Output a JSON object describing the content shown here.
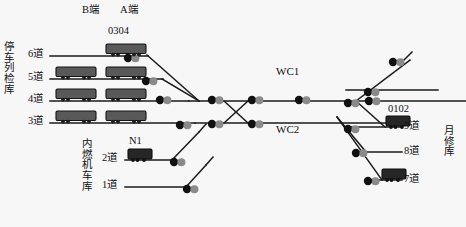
{
  "diagram": {
    "kind": "railway-depot-track-layout",
    "background_color": "#f7f7f7",
    "line_color": "#1a1a1a",
    "car_fill": "#595959",
    "loco_fill": "#262626",
    "switch_black": "#111111",
    "switch_gray": "#8a8a8a"
  },
  "ends": {
    "b_end": "B端",
    "a_end": "A端"
  },
  "buildings": {
    "left": {
      "name": "停车列检库",
      "chars": [
        "停",
        "车",
        "列",
        "检",
        "库"
      ]
    },
    "lower_left": {
      "name": "内燃机车库",
      "chars": [
        "内",
        "燃",
        "机",
        "车",
        "库"
      ]
    },
    "right": {
      "name": "月修库",
      "chars": [
        "月",
        "修",
        "库"
      ]
    }
  },
  "main_lines": [
    {
      "id": "wc1",
      "label": "WC1"
    },
    {
      "id": "wc2",
      "label": "WC2"
    }
  ],
  "tracks": [
    {
      "id": "t6",
      "label": "6道",
      "building": "停车列检库"
    },
    {
      "id": "t5",
      "label": "5道",
      "building": "停车列检库"
    },
    {
      "id": "t4",
      "label": "4道",
      "building": "停车列检库"
    },
    {
      "id": "t3",
      "label": "3道",
      "building": "停车列检库"
    },
    {
      "id": "t2",
      "label": "2道",
      "building": "内燃机车库"
    },
    {
      "id": "t1",
      "label": "1道",
      "building": "内燃机车库"
    },
    {
      "id": "t9",
      "label": "9道",
      "building": "月修库"
    },
    {
      "id": "t8",
      "label": "8道",
      "building": "月修库"
    },
    {
      "id": "t7",
      "label": "7道",
      "building": "月修库"
    }
  ],
  "rolling_stock_labels": [
    {
      "id": "unit-0304",
      "label": "0304",
      "on_track": "6道"
    },
    {
      "id": "unit-n1",
      "label": "N1",
      "on_track": "2道"
    },
    {
      "id": "unit-0102",
      "label": "0102",
      "on_track": "9道"
    }
  ],
  "label_positions": {
    "b_end": {
      "x": 82,
      "y": 5
    },
    "a_end": {
      "x": 120,
      "y": 5
    },
    "u0304": {
      "x": 108,
      "y": 26
    },
    "n1": {
      "x": 128,
      "y": 148
    },
    "u0102": {
      "x": 392,
      "y": 117
    },
    "wc1": {
      "x": 276,
      "y": 66
    },
    "wc2": {
      "x": 276,
      "y": 124
    },
    "t6": {
      "x": 29,
      "y": 46
    },
    "t5": {
      "x": 29,
      "y": 70
    },
    "t4": {
      "x": 29,
      "y": 92
    },
    "t3": {
      "x": 29,
      "y": 114
    },
    "t2": {
      "x": 103,
      "y": 161
    },
    "t1": {
      "x": 103,
      "y": 188
    },
    "t9": {
      "x": 405,
      "y": 131
    },
    "t8": {
      "x": 405,
      "y": 157
    },
    "t7": {
      "x": 405,
      "y": 182
    },
    "left_building": {
      "x": 6,
      "y": 42
    },
    "lower_building": {
      "x": 83,
      "y": 142
    },
    "right_building": {
      "x": 443,
      "y": 127
    }
  }
}
